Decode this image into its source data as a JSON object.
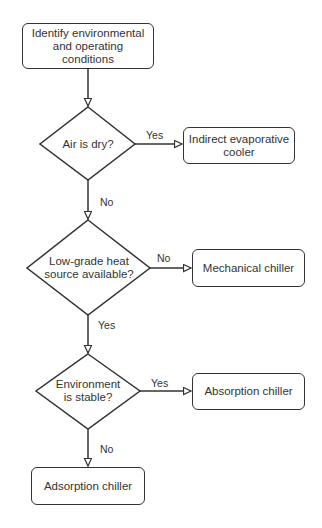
{
  "diagram": {
    "type": "flowchart",
    "nodes": {
      "start": {
        "shape": "rounded-rect",
        "label": "Identify environmental and operating conditions",
        "lines": [
          "Identify environmental",
          "and operating conditions"
        ]
      },
      "q_dry": {
        "shape": "diamond",
        "label": "Air is dry?"
      },
      "indirect": {
        "shape": "rounded-rect",
        "label": "Indirect evaporative cooler",
        "lines": [
          "Indirect evaporative",
          "cooler"
        ]
      },
      "q_heat": {
        "shape": "diamond",
        "label": "Low-grade heat source available?",
        "lines": [
          "Low-grade heat",
          "source available?"
        ]
      },
      "mechanical": {
        "shape": "rounded-rect",
        "label": "Mechanical chiller"
      },
      "q_stable": {
        "shape": "diamond",
        "label": "Environment is stable?",
        "lines": [
          "Environment",
          "is stable?"
        ]
      },
      "absorption": {
        "shape": "rounded-rect",
        "label": "Absorption chiller"
      },
      "adsorption": {
        "shape": "rounded-rect",
        "label": "Adsorption chiller"
      }
    },
    "edges": [
      {
        "from": "start",
        "to": "q_dry",
        "label": ""
      },
      {
        "from": "q_dry",
        "to": "indirect",
        "label": "Yes"
      },
      {
        "from": "q_dry",
        "to": "q_heat",
        "label": "No"
      },
      {
        "from": "q_heat",
        "to": "mechanical",
        "label": "No"
      },
      {
        "from": "q_heat",
        "to": "q_stable",
        "label": "Yes"
      },
      {
        "from": "q_stable",
        "to": "absorption",
        "label": "Yes"
      },
      {
        "from": "q_stable",
        "to": "adsorption",
        "label": "No"
      }
    ],
    "colors": {
      "stroke": "#333333",
      "text": "#333333",
      "fill": "#ffffff",
      "background": "#ffffff"
    }
  }
}
